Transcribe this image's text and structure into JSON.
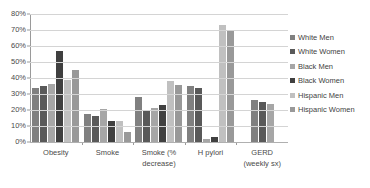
{
  "chart_data": {
    "type": "bar",
    "title": "",
    "xlabel": "",
    "ylabel": "",
    "ylim": [
      0,
      80
    ],
    "ytick_labels": [
      "80%",
      "70%",
      "60%",
      "50%",
      "40%",
      "30%",
      "20%",
      "10%",
      "0%"
    ],
    "ytick_values": [
      80,
      70,
      60,
      50,
      40,
      30,
      20,
      10,
      0
    ],
    "grid": true,
    "legend_position": "right",
    "categories": [
      "Obesity",
      "Smoke",
      "Smoke (% decrease)",
      "H pylori",
      "GERD (weekly sx)"
    ],
    "category_lines": [
      [
        "Obesity",
        ""
      ],
      [
        "Smoke",
        ""
      ],
      [
        "Smoke (%",
        "decrease)"
      ],
      [
        "H pylori",
        ""
      ],
      [
        "GERD",
        "(weekly sx)"
      ]
    ],
    "series": [
      {
        "name": "White Men",
        "color": "#808080",
        "values": [
          33.5,
          17.5,
          28.0,
          35.0,
          26.0
        ]
      },
      {
        "name": "White Women",
        "color": "#595959",
        "values": [
          35.0,
          16.0,
          20.0,
          34.0,
          25.0
        ]
      },
      {
        "name": "Black Men",
        "color": "#a6a6a6",
        "values": [
          36.0,
          20.5,
          21.5,
          2.0,
          24.0
        ]
      },
      {
        "name": "Black Women",
        "color": "#404040",
        "values": [
          57.0,
          13.0,
          23.0,
          3.0,
          null
        ]
      },
      {
        "name": "Hispanic Men",
        "color": "#c0c0c0",
        "values": [
          38.5,
          13.0,
          38.0,
          73.0,
          null
        ]
      },
      {
        "name": "Hispanic Women",
        "color": "#999999",
        "values": [
          45.0,
          6.5,
          35.5,
          70.0,
          null
        ]
      }
    ]
  },
  "legend": {
    "items": [
      {
        "label": "White Men",
        "color": "#808080"
      },
      {
        "label": "White Women",
        "color": "#595959"
      },
      {
        "label": "Black Men",
        "color": "#a6a6a6"
      },
      {
        "label": "Black Women",
        "color": "#404040"
      },
      {
        "label": "Hispanic Men",
        "color": "#c0c0c0"
      },
      {
        "label": "Hispanic Women",
        "color": "#999999"
      }
    ]
  }
}
